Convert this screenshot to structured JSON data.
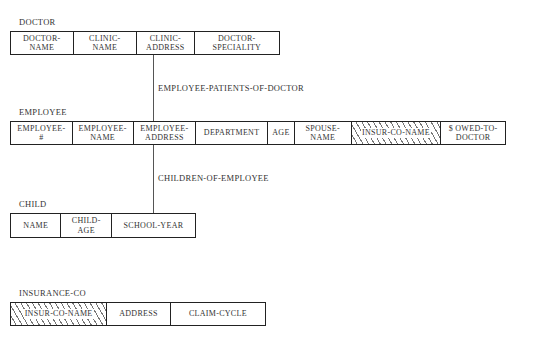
{
  "records": {
    "doctor": {
      "title": "DOCTOR",
      "fields": [
        "DOCTOR-\nNAME",
        "CLINIC-\nNAME",
        "CLINIC-\nADDRESS",
        "DOCTOR-\nSPECIALITY"
      ]
    },
    "employee": {
      "title": "EMPLOYEE",
      "fields": [
        "EMPLOYEE-\n#",
        "EMPLOYEE-\nNAME",
        "EMPLOYEE-\nADDRESS",
        "DEPARTMENT",
        "AGE",
        "SPOUSE-\nNAME",
        "INSUR-CO-NAME",
        "$ OWED-TO-\nDOCTOR"
      ]
    },
    "child": {
      "title": "CHILD",
      "fields": [
        "NAME",
        "CHILD-\nAGE",
        "SCHOOL-YEAR"
      ]
    },
    "insurance_co": {
      "title": "INSURANCE-CO",
      "fields": [
        "INSUR-CO-NAME",
        "ADDRESS",
        "CLAIM-CYCLE"
      ]
    }
  },
  "relationships": {
    "doctor_employee": "EMPLOYEE-PATIENTS-OF-DOCTOR",
    "employee_child": "CHILDREN-OF-EMPLOYEE"
  },
  "hatched_fields_note": "INSUR-CO-NAME"
}
